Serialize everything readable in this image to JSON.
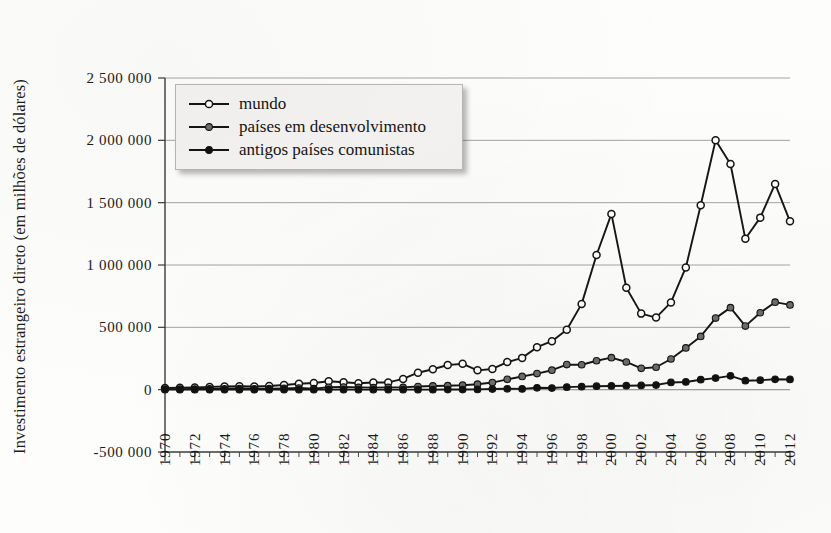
{
  "figure": {
    "ylabel": "Investimento estrangeiro direto (em milhões de dólares)"
  },
  "legend": {
    "items": [
      {
        "label": "mundo",
        "marker": "hollow-circle-marker",
        "color": "#ffffff"
      },
      {
        "label": "países em desenvolvimento",
        "marker": "gray-circle-marker",
        "color": "#6d6d6d"
      },
      {
        "label": "antigos países comunistas",
        "marker": "black-circle-marker",
        "color": "#111111"
      }
    ]
  },
  "chart_data": {
    "type": "line",
    "title": "",
    "xlabel": "",
    "ylabel": "Investimento estrangeiro direto (em milhões de dólares)",
    "ylim": [
      -500000,
      2500000
    ],
    "xlim": [
      1970,
      2012
    ],
    "grid": true,
    "legend_position": "top-left",
    "ytick_labels": [
      "2 500 000",
      "2 000 000",
      "1 500 000",
      "1 000 000",
      "500 000",
      "0",
      "-500 000"
    ],
    "ytick_values": [
      2500000,
      2000000,
      1500000,
      1000000,
      500000,
      0,
      -500000
    ],
    "xtick_labels": [
      "1970",
      "1972",
      "1974",
      "1976",
      "1978",
      "1980",
      "1982",
      "1984",
      "1986",
      "1988",
      "1990",
      "1992",
      "1994",
      "1996",
      "1998",
      "2000",
      "2002",
      "2004",
      "2006",
      "2008",
      "2010",
      "2012"
    ],
    "x": [
      1970,
      1971,
      1972,
      1973,
      1974,
      1975,
      1976,
      1977,
      1978,
      1979,
      1980,
      1981,
      1982,
      1983,
      1984,
      1985,
      1986,
      1987,
      1988,
      1989,
      1990,
      1991,
      1992,
      1993,
      1994,
      1995,
      1996,
      1997,
      1998,
      1999,
      2000,
      2001,
      2002,
      2003,
      2004,
      2005,
      2006,
      2007,
      2008,
      2009,
      2010,
      2011,
      2012
    ],
    "series": [
      {
        "name": "mundo",
        "marker": "hollow-circle-marker",
        "color": "#ffffff",
        "values": [
          13000,
          16000,
          18000,
          22000,
          25000,
          27000,
          26000,
          29000,
          38000,
          47000,
          54000,
          68000,
          59000,
          52000,
          57000,
          58000,
          86000,
          136000,
          164000,
          198000,
          207000,
          155000,
          166000,
          221000,
          255000,
          341000,
          389000,
          481000,
          688000,
          1080000,
          1410000,
          818000,
          610000,
          578000,
          700000,
          980000,
          1480000,
          2000000,
          1810000,
          1210000,
          1380000,
          1650000,
          1350000
        ]
      },
      {
        "name": "países em desenvolvimento",
        "marker": "gray-circle-marker",
        "color": "#6d6d6d",
        "values": [
          4000,
          4500,
          5000,
          6000,
          7000,
          8000,
          7000,
          8000,
          10000,
          13000,
          8000,
          19000,
          21000,
          18000,
          16000,
          18000,
          18000,
          25000,
          30000,
          32000,
          36000,
          44000,
          57000,
          83000,
          106000,
          129000,
          156000,
          201000,
          200000,
          232000,
          257000,
          222000,
          171000,
          180000,
          246000,
          335000,
          427000,
          574000,
          658000,
          510000,
          617000,
          702000,
          680000
        ]
      },
      {
        "name": "antigos países comunistas",
        "marker": "black-circle-marker",
        "color": "#111111",
        "values": [
          0,
          0,
          0,
          0,
          0,
          0,
          0,
          0,
          0,
          0,
          0,
          0,
          0,
          0,
          0,
          0,
          0,
          0,
          0,
          1000,
          1000,
          2000,
          5000,
          7000,
          6000,
          15000,
          13000,
          20000,
          24000,
          28000,
          30000,
          32000,
          34000,
          37000,
          58000,
          62000,
          80000,
          93000,
          111000,
          72000,
          76000,
          83000,
          82000
        ]
      }
    ]
  }
}
